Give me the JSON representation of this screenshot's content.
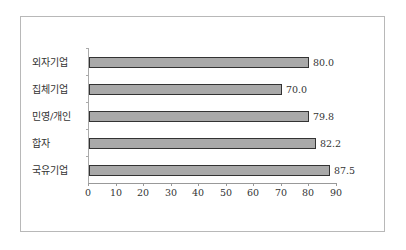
{
  "chart_data": {
    "type": "bar",
    "orientation": "horizontal",
    "title": "",
    "xlabel": "",
    "ylabel": "",
    "categories": [
      "외자기업",
      "집체기업",
      "민영/개인",
      "합자",
      "국유기업"
    ],
    "values": [
      80.0,
      70.0,
      79.8,
      82.2,
      87.5
    ],
    "value_labels": [
      "80.0",
      "70.0",
      "79.8",
      "82.2",
      "87.5"
    ],
    "xlim": [
      0,
      90
    ],
    "xticks": [
      "0",
      "10",
      "20",
      "30",
      "40",
      "50",
      "60",
      "70",
      "80",
      "90"
    ],
    "grid": false,
    "legend": null,
    "colors": {
      "bar_fill": "#a9a9a9",
      "bar_border": "#333333",
      "frame": "#b8b8b8"
    }
  }
}
